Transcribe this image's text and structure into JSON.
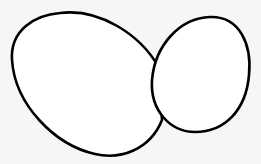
{
  "diagram": {
    "background": "#f6f6f6",
    "stroke": "#000000",
    "fill": "#ffffff",
    "shapes": [
      {
        "name": "large-egg",
        "type": "ellipse-outline"
      },
      {
        "name": "small-egg",
        "type": "ellipse-outline"
      }
    ]
  }
}
